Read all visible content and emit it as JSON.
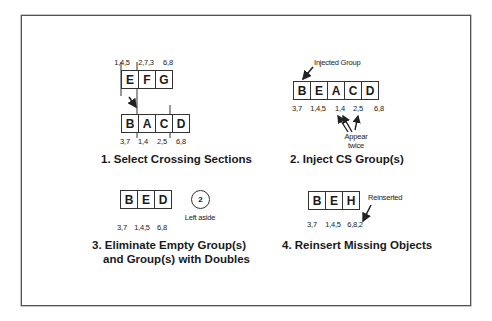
{
  "panels": [
    {
      "title": "1. Select Crossing Sections",
      "top_group": {
        "cells": [
          "E",
          "F",
          "G"
        ],
        "labels": [
          "1,4,5",
          "2,7,3",
          "6,8"
        ]
      },
      "bottom_group": {
        "cells": [
          "B",
          "A",
          "C",
          "D"
        ],
        "labels": [
          "3,7",
          "1,4",
          "2,5",
          "6,8"
        ]
      }
    },
    {
      "title": "2. Inject CS Group(s)",
      "group": {
        "cells": [
          "B",
          "E",
          "A",
          "C",
          "D"
        ],
        "labels": [
          "3,7",
          "1,4,5",
          "1,4",
          "2,5",
          "6,8"
        ]
      },
      "annotation_injected": "Injected Group",
      "annotation_twice_line1": "Appear",
      "annotation_twice_line2": "twice"
    },
    {
      "title_line1": "3. Eliminate Empty Group(s)",
      "title_line2": "and Group(s) with Doubles",
      "group": {
        "cells": [
          "B",
          "E",
          "D"
        ],
        "labels": [
          "3,7",
          "1,4,5",
          "6,8"
        ]
      },
      "aside_number": "2",
      "aside_label": "Left aside"
    },
    {
      "title": "4. Reinsert Missing Objects",
      "group": {
        "cells": [
          "B",
          "E",
          "H"
        ],
        "labels": [
          "3,7",
          "1,4,5",
          "6,8,2"
        ]
      },
      "annotation": "Reinserted"
    }
  ]
}
